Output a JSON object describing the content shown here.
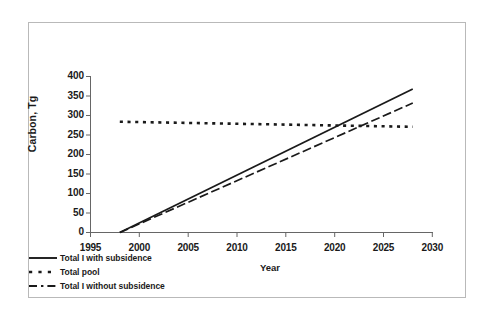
{
  "chart_data": {
    "type": "line",
    "title": "",
    "xlabel": "Year",
    "ylabel": "Carbon, Tg",
    "xlim": [
      1995,
      2030
    ],
    "ylim": [
      0,
      400
    ],
    "xticks": [
      1995,
      2000,
      2005,
      2010,
      2015,
      2020,
      2025,
      2030
    ],
    "yticks": [
      0,
      50,
      100,
      150,
      200,
      250,
      300,
      350,
      400
    ],
    "grid": false,
    "legend_position": "bottom-left",
    "series": [
      {
        "name": "Total I with subsidence",
        "style": "solid",
        "color": "#1a1a1a",
        "x": [
          1998,
          2003,
          2008,
          2013,
          2018,
          2023,
          2028
        ],
        "values": [
          0,
          61,
          123,
          184,
          245,
          307,
          368
        ]
      },
      {
        "name": "Total pool",
        "style": "dotted",
        "color": "#1a1a1a",
        "x": [
          1998,
          2003,
          2008,
          2013,
          2018,
          2023,
          2028
        ],
        "values": [
          284,
          282,
          280,
          278,
          276,
          273,
          271
        ]
      },
      {
        "name": "Total I without subsidence",
        "style": "dash-dot",
        "color": "#1a1a1a",
        "x": [
          1998,
          2003,
          2008,
          2013,
          2018,
          2023,
          2028
        ],
        "values": [
          0,
          55,
          111,
          166,
          222,
          277,
          332
        ]
      }
    ]
  },
  "axes": {
    "y_title": "Carbon, Tg",
    "x_title": "Year",
    "y_tick_labels": [
      "400",
      "350",
      "300",
      "250",
      "200",
      "150",
      "100",
      "50",
      "0"
    ],
    "x_tick_labels": [
      "1995",
      "2000",
      "2005",
      "2010",
      "2015",
      "2020",
      "2025",
      "2030"
    ]
  },
  "legend": {
    "items": [
      {
        "label": "Total I with subsidence",
        "style": "solid"
      },
      {
        "label": "Total pool",
        "style": "dotted"
      },
      {
        "label": "Total I without subsidence",
        "style": "dash-dot"
      }
    ]
  },
  "colors": {
    "line": "#1a1a1a",
    "axis": "#555555",
    "frame": "#b9b9b9",
    "background": "#ffffff"
  }
}
